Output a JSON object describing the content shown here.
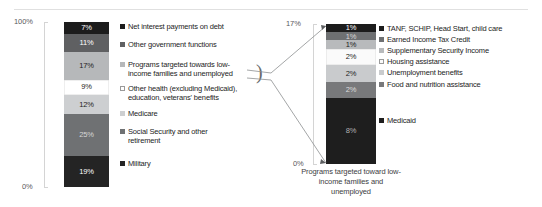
{
  "chart_data": [
    {
      "type": "bar",
      "id": "federal-spending-overview",
      "title": "",
      "subtitle": "",
      "xlabel": "",
      "ylabel": "",
      "stacked": true,
      "orientation": "vertical",
      "grid": false,
      "legend_position": "right",
      "ylim": [
        0,
        100
      ],
      "ytick_labels": [
        "100%",
        "0%"
      ],
      "categories": [
        "Federal spending"
      ],
      "series": [
        {
          "name": "Net interest payments on debt",
          "value": 7,
          "data_label": "7%",
          "color": "#1c1c1c",
          "label_color": "#ffffff"
        },
        {
          "name": "Other government functions",
          "value": 11,
          "data_label": "11%",
          "color": "#5f6062",
          "label_color": "#ffffff"
        },
        {
          "name": "Programs targeted towards low-income families and unemployed",
          "value": 17,
          "data_label": "17%",
          "color": "#b6b8ba",
          "label_color": "#1d1d1d"
        },
        {
          "name": "Other health (excluding Medicaid), education, veterans' benefits",
          "value": 9,
          "data_label": "9%",
          "color": "#ffffff",
          "label_color": "#1d1d1d"
        },
        {
          "name": "Medicare",
          "value": 12,
          "data_label": "12%",
          "color": "#cdcfd1",
          "label_color": "#1d1d1d"
        },
        {
          "name": "Social Security and other retirement",
          "value": 25,
          "data_label": "25%",
          "color": "#6f7173",
          "label_color": "#d6d6d6"
        },
        {
          "name": "Military",
          "value": 19,
          "data_label": "19%",
          "color": "#242424",
          "label_color": "#ffffff"
        }
      ]
    },
    {
      "type": "bar",
      "id": "low-income-programs-breakout",
      "title": "",
      "subtitle": "",
      "xlabel": "Programs targeted toward\nlow-income families and\nunemployed",
      "ylabel": "",
      "stacked": true,
      "orientation": "vertical",
      "grid": false,
      "legend_position": "right",
      "ylim": [
        0,
        17
      ],
      "ytick_labels": [
        "17%",
        "0%"
      ],
      "categories": [
        "Programs targeted toward low-income families and unemployed"
      ],
      "series": [
        {
          "name": "TANF, SCHIP, Head Start, child care",
          "value": 1,
          "data_label": "1%",
          "color": "#1c1c1c",
          "label_color": "#ffffff"
        },
        {
          "name": "Earned Income Tax Credit",
          "value": 1,
          "data_label": "1%",
          "color": "#6e7072",
          "label_color": "#d9d9d9"
        },
        {
          "name": "Supplementary Security Income",
          "value": 1,
          "data_label": "1%",
          "color": "#b8babc",
          "label_color": "#1d1d1d"
        },
        {
          "name": "Housing assistance",
          "value": 2,
          "data_label": "2%",
          "color": "#fafafa",
          "label_color": "#1d1d1d"
        },
        {
          "name": "Unemployment benefits",
          "value": 2,
          "data_label": "2%",
          "color": "#c9cbcd",
          "label_color": "#1d1d1d"
        },
        {
          "name": "Food and nutrition assistance",
          "value": 2,
          "data_label": "2%",
          "color": "#78797b",
          "label_color": "#dddddd"
        },
        {
          "name": "Medicaid",
          "value": 8,
          "data_label": "8%",
          "color": "#1e1e1e",
          "label_color": "#b3b3b3"
        }
      ]
    }
  ],
  "left": {
    "axis": {
      "top_label": "100%",
      "bottom_label": "0%"
    },
    "legend_items": [
      {
        "label": "Net interest payments on debt",
        "swatch": "#1c1c1c",
        "icon": "legend-swatch-icon"
      },
      {
        "label": "Other government functions",
        "swatch": "#5f6062",
        "icon": "legend-swatch-icon"
      },
      {
        "label": "Programs targeted towards low-\nincome families and unemployed",
        "swatch": "#b6b8ba",
        "icon": "legend-swatch-icon"
      },
      {
        "label": "Other health (excluding Medicaid),\neducation, veterans' benefits",
        "swatch": "#ffffff",
        "icon": "legend-swatch-icon"
      },
      {
        "label": "Medicare",
        "swatch": "#cdcfd1",
        "icon": "legend-swatch-icon"
      },
      {
        "label": "Social Security and other\nretirement",
        "swatch": "#6f7173",
        "icon": "legend-swatch-icon"
      },
      {
        "label": "Military",
        "swatch": "#242424",
        "icon": "legend-swatch-icon"
      }
    ],
    "brace": ")"
  },
  "right": {
    "axis": {
      "top_label": "17%",
      "bottom_label": "0%"
    },
    "legend_items": [
      {
        "label": "TANF, SCHIP, Head Start, child care",
        "swatch": "#1c1c1c",
        "icon": "legend-swatch-icon"
      },
      {
        "label": "Earned Income Tax Credit",
        "swatch": "#6e7072",
        "icon": "legend-swatch-icon"
      },
      {
        "label": "Supplementary Security Income",
        "swatch": "#b8babc",
        "icon": "legend-swatch-icon"
      },
      {
        "label": "Housing assistance",
        "swatch": "#fafafa",
        "icon": "legend-swatch-icon"
      },
      {
        "label": "Unemployment benefits",
        "swatch": "#c9cbcd",
        "icon": "legend-swatch-icon"
      },
      {
        "label": "Food and nutrition assistance",
        "swatch": "#78797b",
        "icon": "legend-swatch-icon"
      },
      {
        "label": "Medicaid",
        "swatch": "#1e1e1e",
        "icon": "legend-swatch-icon"
      }
    ],
    "caption": "Programs targeted toward\nlow-income families and\nunemployed"
  }
}
